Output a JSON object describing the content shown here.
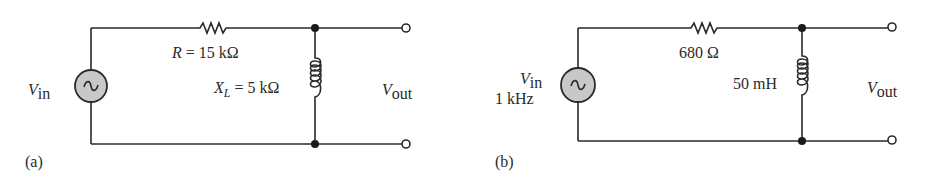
{
  "figure": {
    "circuits": [
      {
        "id": "a",
        "panel_label": "(a)",
        "source": {
          "symbol": "V",
          "subscript": "in",
          "extra": ""
        },
        "resistor": {
          "label": "R = 15  kΩ"
        },
        "inductor": {
          "label_main": "X",
          "label_sub": "L",
          "label_rest": " =  5 kΩ"
        },
        "output": {
          "symbol": "V",
          "subscript": "out"
        }
      },
      {
        "id": "b",
        "panel_label": "(b)",
        "source": {
          "symbol": "V",
          "subscript": "in",
          "extra": "1 kHz"
        },
        "resistor": {
          "label": "680  Ω"
        },
        "inductor": {
          "label": "50 mH"
        },
        "output": {
          "symbol": "V",
          "subscript": "out"
        }
      }
    ],
    "colors": {
      "line": "#2a2a2a",
      "source_fill": "#c8c8c8",
      "background": "#ffffff"
    }
  }
}
